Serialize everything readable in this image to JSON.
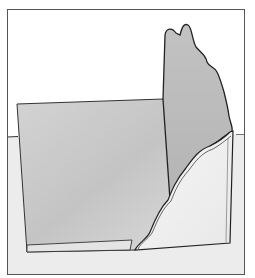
{
  "illustration": {
    "description": "Line-drawn folded panel sculpture with wavy torn edge inside a rectangular frame",
    "colors": {
      "background": "#ffffff",
      "frame_stroke": "#555555",
      "floor": "#ececec",
      "left_panel": "#c9c9c9",
      "back_panel": "#bdbdbd",
      "front_panel": "#f2f2f2",
      "outline": "#222222"
    },
    "frame": {
      "x": 7,
      "y": 9,
      "width": 238,
      "height": 266
    }
  }
}
